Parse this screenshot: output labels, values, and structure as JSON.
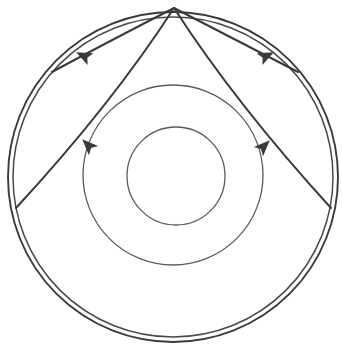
{
  "figure": {
    "background_color": "#ffffff",
    "stroke_color": "#3a3a3a",
    "stroke_color_light": "#5a5a5a",
    "canvas": {
      "width": 342,
      "height": 355
    }
  },
  "chart_data": {
    "type": "diagram",
    "title": "",
    "xlabel": "",
    "ylabel": "",
    "grid": false,
    "legend": "none",
    "apex": {
      "x": 174,
      "y": 8,
      "label": "convergence-point"
    },
    "circles": [
      {
        "name": "outer-circle-outer-ring",
        "cx": 173,
        "cy": 177,
        "r": 165,
        "stroke": "#3a3a3a",
        "stroke_width": 1.9
      },
      {
        "name": "outer-circle-inner-ring",
        "cx": 173,
        "cy": 177,
        "r": 160,
        "stroke": "#4a4a4a",
        "stroke_width": 1.5
      },
      {
        "name": "middle-circle",
        "cx": 173,
        "cy": 175,
        "r": 90,
        "stroke": "#5a5a5a",
        "stroke_width": 1.3
      },
      {
        "name": "inner-circle",
        "cx": 176,
        "cy": 176,
        "r": 49,
        "stroke": "#5a5a5a",
        "stroke_width": 1.3
      }
    ],
    "arcs": [
      {
        "name": "upper-left-arc",
        "from": {
          "x": 174,
          "y": 8
        },
        "to": {
          "x": 52,
          "y": 72
        },
        "control": {
          "x": 104,
          "y": 44
        },
        "arrow_at": {
          "x": 86,
          "y": 57
        },
        "arrow_angle_deg": 206,
        "stroke_width": 2.0
      },
      {
        "name": "upper-right-arc",
        "from": {
          "x": 174,
          "y": 8
        },
        "to": {
          "x": 298,
          "y": 72
        },
        "control": {
          "x": 244,
          "y": 44
        },
        "arrow_at": {
          "x": 264,
          "y": 57
        },
        "arrow_angle_deg": -26,
        "stroke_width": 2.0
      },
      {
        "name": "lower-left-arc",
        "from": {
          "x": 174,
          "y": 8
        },
        "to": {
          "x": 16,
          "y": 208
        },
        "control": {
          "x": 112,
          "y": 104
        },
        "arrow_at": {
          "x": 90,
          "y": 147
        },
        "arrow_angle_deg": 225,
        "stroke_width": 2.0
      },
      {
        "name": "lower-right-arc",
        "from": {
          "x": 174,
          "y": 8
        },
        "to": {
          "x": 331,
          "y": 208
        },
        "control": {
          "x": 236,
          "y": 104
        },
        "arrow_at": {
          "x": 262,
          "y": 148
        },
        "arrow_angle_deg": -45,
        "stroke_width": 2.0
      }
    ],
    "arrow_markers": [
      {
        "name": "arrow-upper-left",
        "x": 86,
        "y": 57,
        "direction": "down-left"
      },
      {
        "name": "arrow-upper-right",
        "x": 264,
        "y": 57,
        "direction": "down-right"
      },
      {
        "name": "arrow-lower-left",
        "x": 90,
        "y": 147,
        "direction": "down-left"
      },
      {
        "name": "arrow-lower-right",
        "x": 262,
        "y": 148,
        "direction": "down-right"
      }
    ],
    "annotations": []
  }
}
